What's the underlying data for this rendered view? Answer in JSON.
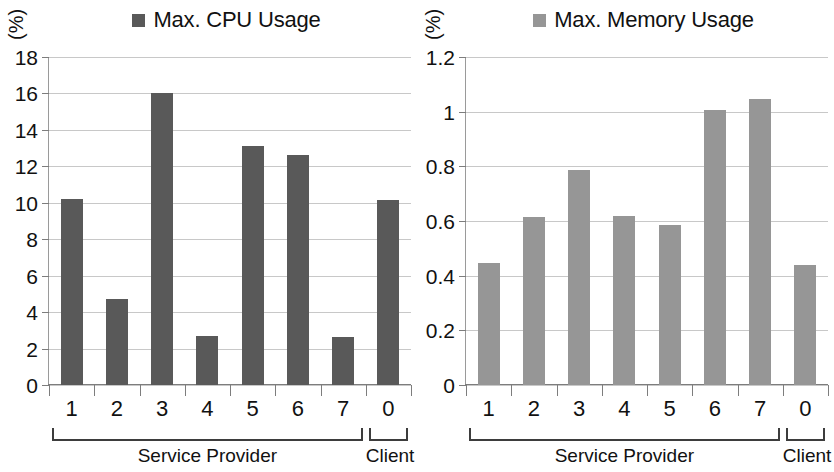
{
  "charts": [
    {
      "panel_id": "cpu",
      "unit_label": "(%)",
      "legend_label": "Max. CPU Usage",
      "legend_color": "#595959",
      "bar_color": "#595959"
    },
    {
      "panel_id": "memory",
      "unit_label": "(%)",
      "legend_label": "Max. Memory Usage",
      "legend_color": "#969696",
      "bar_color": "#969696"
    }
  ],
  "groups": {
    "service_provider_label": "Service Provider",
    "client_label": "Client"
  },
  "chart_data": [
    {
      "type": "bar",
      "title": "",
      "series_name": "Max. CPU Usage",
      "legend": [
        "Max. CPU Usage"
      ],
      "legend_position": "top-center",
      "xlabel": "Service Provider / Client",
      "ylabel": "(%)",
      "categories": [
        "1",
        "2",
        "3",
        "4",
        "5",
        "6",
        "7",
        "0"
      ],
      "category_groups": [
        {
          "label": "Service Provider",
          "categories": [
            "1",
            "2",
            "3",
            "4",
            "5",
            "6",
            "7"
          ]
        },
        {
          "label": "Client",
          "categories": [
            "0"
          ]
        }
      ],
      "values": [
        10.2,
        4.7,
        16.0,
        2.7,
        13.1,
        12.65,
        2.65,
        10.15
      ],
      "ylim": [
        0,
        18
      ],
      "ytick_labels": [
        "0",
        "2",
        "4",
        "6",
        "8",
        "10",
        "12",
        "14",
        "16",
        "18"
      ],
      "ytick_values": [
        0,
        2,
        4,
        6,
        8,
        10,
        12,
        14,
        16,
        18
      ],
      "grid": true,
      "bar_color": "#595959"
    },
    {
      "type": "bar",
      "title": "",
      "series_name": "Max. Memory Usage",
      "legend": [
        "Max. Memory Usage"
      ],
      "legend_position": "top-center",
      "xlabel": "Service Provider / Client",
      "ylabel": "(%)",
      "categories": [
        "1",
        "2",
        "3",
        "4",
        "5",
        "6",
        "7",
        "0"
      ],
      "category_groups": [
        {
          "label": "Service Provider",
          "categories": [
            "1",
            "2",
            "3",
            "4",
            "5",
            "6",
            "7"
          ]
        },
        {
          "label": "Client",
          "categories": [
            "0"
          ]
        }
      ],
      "values": [
        0.445,
        0.615,
        0.785,
        0.62,
        0.585,
        1.005,
        1.045,
        0.44
      ],
      "ylim": [
        0,
        1.2
      ],
      "ytick_labels": [
        "0",
        "0.2",
        "0.4",
        "0.6",
        "0.8",
        "1",
        "1.2"
      ],
      "ytick_values": [
        0,
        0.2,
        0.4,
        0.6,
        0.8,
        1,
        1.2
      ],
      "grid": true,
      "bar_color": "#969696"
    }
  ]
}
